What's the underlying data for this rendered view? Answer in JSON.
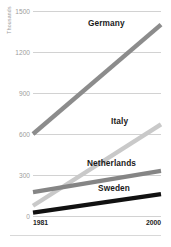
{
  "chart_data": {
    "type": "line",
    "title": "",
    "subtitle": "",
    "xlabel": "",
    "ylabel": "Thousands",
    "x": [
      1981,
      2000
    ],
    "xlim": [
      1981,
      2000
    ],
    "ylim": [
      0,
      1500
    ],
    "xticks": [
      "1981",
      "2000"
    ],
    "yticks": [
      "0",
      "300",
      "600",
      "900",
      "1200",
      "1500"
    ],
    "ytick_values": [
      0,
      300,
      600,
      900,
      1200,
      1500
    ],
    "grid": "horizontal",
    "legend_position": "inline-labels",
    "series": [
      {
        "name": "Germany",
        "values": [
          600,
          1400
        ],
        "color": "#8c8c8c",
        "label": "Germany"
      },
      {
        "name": "Italy",
        "values": [
          75,
          670
        ],
        "color": "#c9c9c9",
        "label": "Italy"
      },
      {
        "name": "Netherlands",
        "values": [
          175,
          330
        ],
        "color": "#858585",
        "label": "Netherlands"
      },
      {
        "name": "Sweden",
        "values": [
          25,
          160
        ],
        "color": "#111111",
        "label": "Sweden"
      }
    ]
  },
  "axis": {
    "y_title": "Thousands",
    "y_labels": [
      "1500",
      "1200",
      "900",
      "600",
      "300",
      "0"
    ],
    "x_start_label": "1981",
    "x_end_label": "2000"
  },
  "colors": {
    "gridline": "#d2d2d2",
    "ytick_text": "#9d9d9d",
    "xtick_text": "#1c1c1c",
    "series_label_text": "#1a1a1a",
    "background": "#ffffff",
    "bottom_rule": "#d8d8d8"
  }
}
